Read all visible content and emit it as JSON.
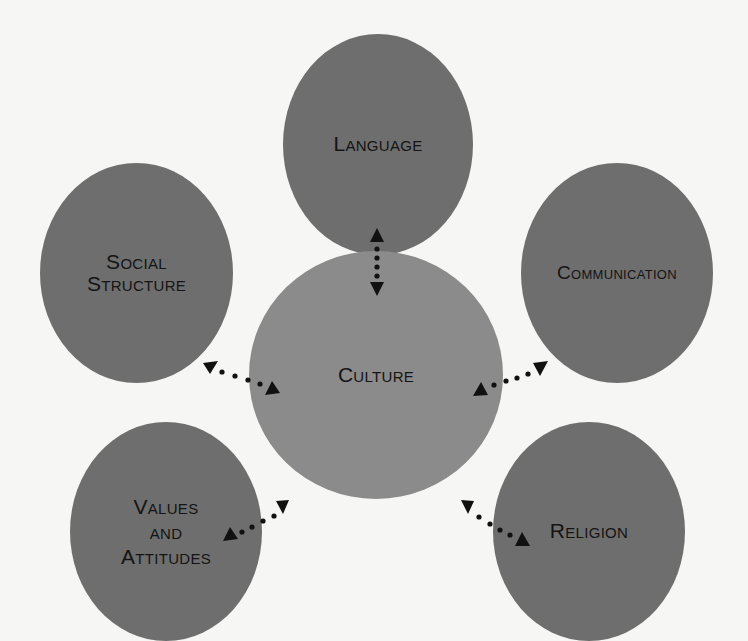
{
  "diagram": {
    "type": "hub-and-spoke",
    "colors": {
      "background": "#f6f6f4",
      "outer_node": "#6e6e6e",
      "center_node": "#8b8b8b",
      "text": "#141414",
      "arrow": "#111111"
    },
    "center": {
      "label": "Culture"
    },
    "nodes": [
      {
        "id": "language",
        "label": "Language"
      },
      {
        "id": "social-structure",
        "label": "Social\nStructure"
      },
      {
        "id": "communication",
        "label": "Communication"
      },
      {
        "id": "values-and-attitudes",
        "label": "Values\nand\nAttitudes"
      },
      {
        "id": "religion",
        "label": "Religion"
      }
    ],
    "connections": [
      {
        "from": "culture",
        "to": "language",
        "style": "dotted",
        "direction": "bidirectional"
      },
      {
        "from": "culture",
        "to": "social-structure",
        "style": "dotted",
        "direction": "bidirectional"
      },
      {
        "from": "culture",
        "to": "communication",
        "style": "dotted",
        "direction": "bidirectional"
      },
      {
        "from": "culture",
        "to": "values-and-attitudes",
        "style": "dotted",
        "direction": "bidirectional"
      },
      {
        "from": "culture",
        "to": "religion",
        "style": "dotted",
        "direction": "bidirectional"
      }
    ]
  }
}
